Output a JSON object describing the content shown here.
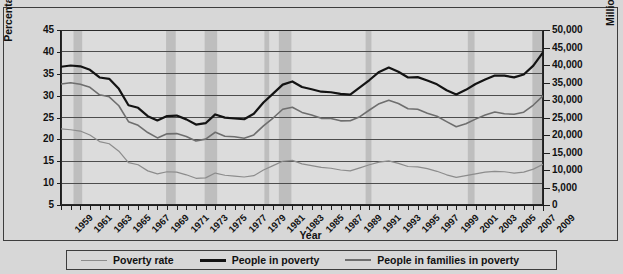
{
  "chart_data": {
    "type": "line",
    "title": "",
    "xlabel": "Year",
    "ylabel": "Percentage in poverty",
    "ylabel_right": "Millions in poverty",
    "grid": true,
    "legend_position": "bottom",
    "x": [
      1959,
      1960,
      1961,
      1962,
      1963,
      1964,
      1965,
      1966,
      1967,
      1968,
      1969,
      1970,
      1971,
      1972,
      1973,
      1974,
      1975,
      1976,
      1977,
      1978,
      1979,
      1980,
      1981,
      1982,
      1983,
      1984,
      1985,
      1986,
      1987,
      1988,
      1989,
      1990,
      1991,
      1992,
      1993,
      1994,
      1995,
      1996,
      1997,
      1998,
      1999,
      2000,
      2001,
      2002,
      2003,
      2004,
      2005,
      2006,
      2007,
      2008,
      2009
    ],
    "xtick_labels": [
      "1959",
      "1961",
      "1963",
      "1965",
      "1967",
      "1969",
      "1971",
      "1973",
      "1975",
      "1977",
      "1979",
      "1981",
      "1983",
      "1985",
      "1987",
      "1989",
      "1991",
      "1993",
      "1995",
      "1997",
      "1999",
      "2001",
      "2003",
      "2005",
      "2007",
      "2009"
    ],
    "xlim": [
      1959,
      2009
    ],
    "ylim_left": [
      5,
      45
    ],
    "ylim_right": [
      0,
      50000
    ],
    "ytick_labels_left": [
      "45",
      "40",
      "35",
      "30",
      "25",
      "20",
      "15",
      "10",
      "5"
    ],
    "ytick_labels_right": [
      "50,000",
      "45,000",
      "40,000",
      "35,000",
      "30,000",
      "25,000",
      "20,000",
      "15,000",
      "10,000",
      "5,000",
      "0"
    ],
    "recession_bands": [
      {
        "start": 1960.3,
        "end": 1961.2
      },
      {
        "start": 1969.9,
        "end": 1970.9
      },
      {
        "start": 1973.9,
        "end": 1975.2
      },
      {
        "start": 1980.1,
        "end": 1980.6
      },
      {
        "start": 1981.6,
        "end": 1982.9
      },
      {
        "start": 1990.6,
        "end": 1991.2
      },
      {
        "start": 2001.2,
        "end": 2001.9
      },
      {
        "start": 2007.9,
        "end": 2009.4
      }
    ],
    "series": [
      {
        "name": "Poverty rate",
        "axis": "left",
        "units": "percent",
        "color": "#8c8c8c",
        "width": 1.2,
        "values": [
          22.4,
          22.2,
          21.9,
          21.0,
          19.5,
          19.0,
          17.3,
          14.7,
          14.2,
          12.8,
          12.1,
          12.6,
          12.5,
          11.9,
          11.1,
          11.2,
          12.3,
          11.8,
          11.6,
          11.4,
          11.7,
          13.0,
          14.0,
          15.0,
          15.2,
          14.4,
          14.0,
          13.6,
          13.4,
          13.0,
          12.8,
          13.5,
          14.2,
          14.8,
          15.1,
          14.5,
          13.8,
          13.7,
          13.3,
          12.7,
          11.9,
          11.3,
          11.7,
          12.1,
          12.5,
          12.7,
          12.6,
          12.3,
          12.5,
          13.2,
          14.3
        ]
      },
      {
        "name": "People in poverty",
        "axis": "right",
        "units": "thousands",
        "color": "#131313",
        "width": 2.2,
        "values": [
          39490,
          39851,
          39628,
          38625,
          36436,
          36055,
          33185,
          28510,
          27769,
          25389,
          24147,
          25420,
          25559,
          24460,
          22973,
          23370,
          25877,
          24975,
          24720,
          24497,
          26072,
          29272,
          31822,
          34398,
          35303,
          33700,
          33064,
          32370,
          32221,
          31745,
          31528,
          33585,
          35708,
          38014,
          39265,
          38059,
          36425,
          36529,
          35574,
          34476,
          32791,
          31581,
          32907,
          34570,
          35861,
          36997,
          36950,
          36460,
          37276,
          39829,
          43569
        ]
      },
      {
        "name": "People in families in poverty",
        "axis": "right",
        "units": "thousands",
        "color": "#6e6e6e",
        "width": 1.6,
        "values": [
          34562,
          34925,
          34509,
          33623,
          31498,
          30912,
          28358,
          23809,
          22771,
          20695,
          19175,
          20330,
          20405,
          19577,
          18299,
          18817,
          20789,
          19632,
          19505,
          19062,
          20032,
          22601,
          24850,
          27349,
          27933,
          26458,
          25729,
          24754,
          24725,
          24048,
          24066,
          25232,
          27143,
          28961,
          29927,
          28985,
          27501,
          27376,
          26217,
          25370,
          23830,
          22347,
          23215,
          24534,
          25684,
          26564,
          26068,
          25915,
          26509,
          28564,
          31197
        ]
      }
    ]
  },
  "axes": {
    "left_title": "Percentage in poverty",
    "right_title": "Millions in poverty",
    "x_title": "Year"
  },
  "legend": {
    "items": [
      {
        "label": "Poverty rate",
        "color": "#8c8c8c",
        "thickness": "1px"
      },
      {
        "label": "People in poverty",
        "color": "#131313",
        "thickness": "3px"
      },
      {
        "label": "People in families in poverty",
        "color": "#6e6e6e",
        "thickness": "2px"
      }
    ]
  }
}
